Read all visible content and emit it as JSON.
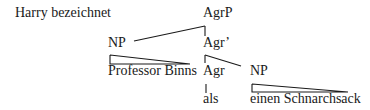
{
  "diagram": {
    "type": "syntax-tree",
    "sentence_prefix": "Harry bezeichnet",
    "nodes": {
      "root": "AgrP",
      "spec_np": "NP",
      "agr_bar": "Agr’",
      "spec_np_terminal": "Professor Binns",
      "agr_head": "Agr",
      "comp_np": "NP",
      "agr_terminal": "als",
      "comp_np_terminal": "einen Schnarchsack"
    }
  }
}
